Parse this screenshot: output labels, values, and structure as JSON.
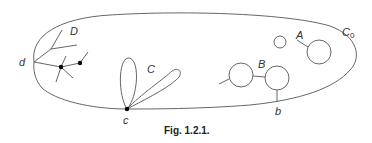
{
  "figure": {
    "caption": "Fig. 1.2.1.",
    "labels": {
      "outer_curve": "C",
      "outer_curve_sub": "0",
      "A": "A",
      "B": "B",
      "C": "C",
      "D": "D",
      "b": "b",
      "c": "c",
      "d": "d"
    },
    "stroke_color": "#555555",
    "node_color": "#000000"
  }
}
